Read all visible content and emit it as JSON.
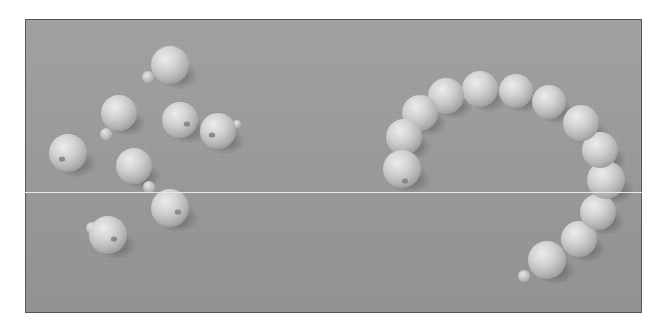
{
  "image": {
    "description": "Grayscale photograph of pop beads on a gray surface: loose beads on the left, a connected chain forming an arc on the right",
    "frame": {
      "x": 25,
      "y": 19,
      "width": 617,
      "height": 294,
      "border_color": "#555555"
    },
    "background_color": "#9c9c9c",
    "bead_color": "#cfcfcf",
    "scanline": {
      "y": 192,
      "color": "#e8e8e8"
    }
  },
  "loose_beads": [
    {
      "cx": 170,
      "cy": 65,
      "r": 19,
      "nub": {
        "x": 148,
        "y": 77,
        "r": 6
      },
      "hole": null
    },
    {
      "cx": 119,
      "cy": 113,
      "r": 18,
      "nub": {
        "x": 106,
        "y": 134,
        "r": 6
      },
      "hole": null
    },
    {
      "cx": 180,
      "cy": 120,
      "r": 18,
      "nub": null,
      "hole": {
        "x": 187,
        "y": 124
      }
    },
    {
      "cx": 218,
      "cy": 131,
      "r": 18,
      "nub": {
        "x": 237,
        "y": 124,
        "r": 4
      },
      "hole": {
        "x": 212,
        "y": 135
      }
    },
    {
      "cx": 68,
      "cy": 153,
      "r": 19,
      "nub": null,
      "hole": {
        "x": 62,
        "y": 159
      }
    },
    {
      "cx": 134,
      "cy": 166,
      "r": 18,
      "nub": {
        "x": 149,
        "y": 187,
        "r": 6
      },
      "hole": null
    },
    {
      "cx": 170,
      "cy": 208,
      "r": 19,
      "nub": null,
      "hole": {
        "x": 178,
        "y": 212
      }
    },
    {
      "cx": 108,
      "cy": 235,
      "r": 19,
      "nub": {
        "x": 92,
        "y": 228,
        "r": 6
      },
      "hole": {
        "x": 114,
        "y": 239
      }
    }
  ],
  "chain_beads": [
    {
      "cx": 402,
      "cy": 169,
      "r": 19,
      "hole": {
        "x": 405,
        "y": 181
      }
    },
    {
      "cx": 404,
      "cy": 137,
      "r": 18
    },
    {
      "cx": 420,
      "cy": 113,
      "r": 18
    },
    {
      "cx": 446,
      "cy": 96,
      "r": 18
    },
    {
      "cx": 480,
      "cy": 89,
      "r": 18
    },
    {
      "cx": 516,
      "cy": 91,
      "r": 17
    },
    {
      "cx": 549,
      "cy": 102,
      "r": 17
    },
    {
      "cx": 581,
      "cy": 123,
      "r": 18
    },
    {
      "cx": 600,
      "cy": 150,
      "r": 18
    },
    {
      "cx": 606,
      "cy": 180,
      "r": 19
    },
    {
      "cx": 598,
      "cy": 212,
      "r": 18
    },
    {
      "cx": 579,
      "cy": 239,
      "r": 18
    },
    {
      "cx": 547,
      "cy": 260,
      "r": 19
    }
  ],
  "chain_end_nub": {
    "x": 524,
    "y": 276,
    "r": 6
  }
}
